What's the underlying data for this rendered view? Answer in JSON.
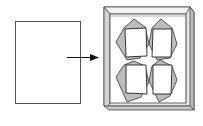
{
  "diagram": {
    "type": "process-illustration",
    "elements": [
      {
        "id": "blank-sheet",
        "label": ""
      },
      {
        "id": "arrow",
        "label": ""
      },
      {
        "id": "frame-with-four-crystals",
        "label": ""
      }
    ],
    "colors": {
      "stroke": "#333333",
      "frame_side": "#cfcfcf",
      "frame_face": "#e4e4e4",
      "crystal_fill": "#bdbdbd",
      "background": "#ffffff"
    },
    "crystal_count": 4
  }
}
